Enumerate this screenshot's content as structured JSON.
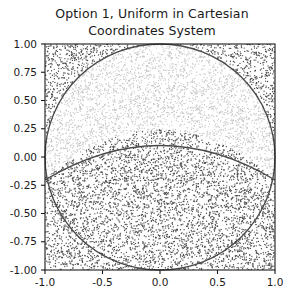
{
  "figure": {
    "title_line1": "Option 1, Uniform in Cartesian",
    "title_line2": "Coordinates System",
    "background_color": "#ffffff"
  },
  "chart_data": {
    "type": "scatter",
    "title": "Option 1, Uniform in Cartesian Coordinates System",
    "xlabel": "",
    "ylabel": "",
    "xlim": [
      -1.0,
      1.0
    ],
    "ylim": [
      -1.0,
      1.0
    ],
    "grid": false,
    "legend": "none",
    "x_ticks": [
      -1.0,
      -0.5,
      0.0,
      0.5,
      1.0
    ],
    "x_tick_labels": [
      "-1.0",
      "-0.5",
      "0.0",
      "0.5",
      "1.0"
    ],
    "y_ticks": [
      1.0,
      0.75,
      0.5,
      0.25,
      0.0,
      -0.25,
      -0.5,
      -0.75,
      -1.0
    ],
    "y_tick_labels": [
      "1.00",
      "0.75",
      "0.50",
      "0.25",
      "0.00",
      "-0.25",
      "-0.50",
      "-0.75",
      "-1.00"
    ],
    "series": [
      {
        "name": "upper-lens-region",
        "color": "#c2c2c2",
        "marker": "point",
        "marker_size": 0.6,
        "n_points": 3000,
        "description": "Light gray uniform points inside unit circle and above dividing curve"
      },
      {
        "name": "lower-and-outside-region",
        "color": "#4d4d4d",
        "marker": "point",
        "marker_size": 0.6,
        "n_points": 5200,
        "description": "Dark gray uniform points below dividing curve or outside unit circle"
      }
    ],
    "annotations": [
      {
        "name": "unit-circle",
        "type": "curve",
        "color": "#4a4a4a",
        "equation": "x^2 + y^2 = 1",
        "radius": 1.0,
        "center": [
          0.0,
          0.0
        ]
      },
      {
        "name": "dividing-curve",
        "type": "curve",
        "color": "#4a4a4a",
        "apex": [
          0.0,
          0.24
        ],
        "left_endpoint": [
          -1.0,
          -0.2
        ],
        "right_endpoint": [
          1.0,
          -0.2
        ],
        "description": "Lower arc separating light and dark sampled regions"
      }
    ]
  }
}
